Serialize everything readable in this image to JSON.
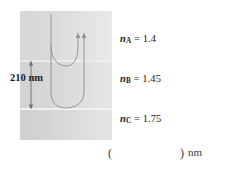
{
  "figure": {
    "caption_blank": {
      "paren_open": "(",
      "paren_close": ")",
      "unit": "nm"
    },
    "thickness": {
      "value": "210 nm"
    },
    "layers": [
      {
        "id": "A",
        "symbol": "n",
        "subscript": "A",
        "equals": " = 1.4",
        "index": 1.4,
        "fill_top": "#d3d3d3",
        "fill_bottom": "#e6e6e6"
      },
      {
        "id": "B",
        "symbol": "n",
        "subscript": "B",
        "equals": " = 1.45",
        "index": 1.45,
        "fill_top": "#cfcfcf",
        "fill_bottom": "#e4e4e4"
      },
      {
        "id": "C",
        "symbol": "n",
        "subscript": "C",
        "equals": " = 1.75",
        "index": 1.75,
        "fill_top": "#cccccc",
        "fill_bottom": "#e2e2e2"
      }
    ],
    "colors": {
      "ray_stroke": "#8a8a8a",
      "boundary_stroke": "#ffffff",
      "dimension_stroke": "#6e6e6e",
      "text": "#1b1b1b",
      "background": "#ffffff"
    },
    "geometry": {
      "block_left": 20,
      "block_right": 112,
      "block_top": 11,
      "boundary_ab": 61,
      "boundary_bc": 109,
      "block_bottom": 140
    }
  }
}
